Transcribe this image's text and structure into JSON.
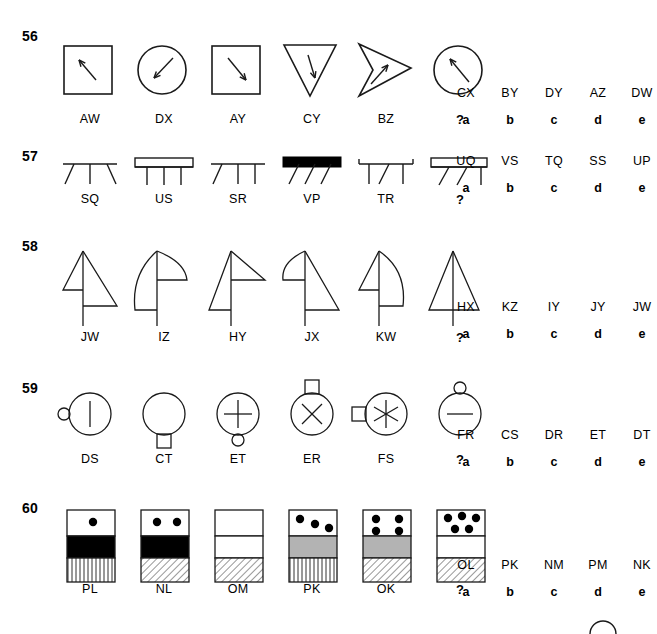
{
  "page": {
    "background": "#ffffff",
    "ink": "#1a1a1a",
    "fill_black": "#000000",
    "fill_grey": "#b3b3b3",
    "fill_white": "#ffffff"
  },
  "questions": [
    {
      "number": "56",
      "top": 28,
      "fig_top": 12,
      "fig_label_top": 84,
      "options_top": 58,
      "figures": [
        {
          "label": "AW",
          "shape": "square-with-arrow-upleft"
        },
        {
          "label": "DX",
          "shape": "circle-with-arrow-downleft"
        },
        {
          "label": "AY",
          "shape": "square-with-arrow-downright"
        },
        {
          "label": "CY",
          "shape": "triangle-down-with-arrow-down"
        },
        {
          "label": "BZ",
          "shape": "arrowhead-with-arrow-upright"
        },
        {
          "label": "?",
          "shape": "circle-with-arrow-upleft"
        }
      ],
      "options": [
        {
          "code": "CX",
          "letter": "a"
        },
        {
          "code": "BY",
          "letter": "b"
        },
        {
          "code": "DY",
          "letter": "c"
        },
        {
          "code": "AZ",
          "letter": "d"
        },
        {
          "code": "DW",
          "letter": "e"
        }
      ]
    },
    {
      "number": "57",
      "top": 148,
      "fig_top": 8,
      "fig_label_top": 44,
      "options_top": 6,
      "figures": [
        {
          "label": "SQ",
          "shape": "thin-bar-3-legs-outward"
        },
        {
          "label": "US",
          "shape": "open-bar-3-legs-vertical"
        },
        {
          "label": "SR",
          "shape": "thin-bar-3-legs-mixed"
        },
        {
          "label": "VP",
          "shape": "solid-bar-3-legs-slanted"
        },
        {
          "label": "TR",
          "shape": "thin-bar-3-legs-brackets"
        },
        {
          "label": "?",
          "shape": "open-bar-3-legs-slanted"
        }
      ],
      "options": [
        {
          "code": "UQ",
          "letter": "a"
        },
        {
          "code": "VS",
          "letter": "b"
        },
        {
          "code": "TQ",
          "letter": "c"
        },
        {
          "code": "SS",
          "letter": "d"
        },
        {
          "code": "UP",
          "letter": "e"
        }
      ]
    },
    {
      "number": "58",
      "top": 238,
      "fig_top": 10,
      "fig_label_top": 92,
      "options_top": 62,
      "figures": [
        {
          "label": "JW",
          "shape": "flag-left-triangle-right-triangle"
        },
        {
          "label": "IZ",
          "shape": "flag-left-curve-right-curve"
        },
        {
          "label": "HY",
          "shape": "flag-left-triangle-right-wedge"
        },
        {
          "label": "JX",
          "shape": "flag-left-curve-right-triangle"
        },
        {
          "label": "KW",
          "shape": "flag-left-triangle-right-curve"
        },
        {
          "label": "?",
          "shape": "plain-triangle-with-stem"
        }
      ],
      "options": [
        {
          "code": "HX",
          "letter": "a"
        },
        {
          "code": "KZ",
          "letter": "b"
        },
        {
          "code": "IY",
          "letter": "c"
        },
        {
          "code": "JY",
          "letter": "d"
        },
        {
          "code": "JW",
          "letter": "e"
        }
      ]
    },
    {
      "number": "59",
      "top": 380,
      "fig_top": 4,
      "fig_label_top": 72,
      "options_top": 48,
      "figures": [
        {
          "label": "DS",
          "shape": "circle-bar-small-circle-left"
        },
        {
          "label": "CT",
          "shape": "circle-plain-square-bottom"
        },
        {
          "label": "ET",
          "shape": "circle-plus-small-circle-bottom"
        },
        {
          "label": "ER",
          "shape": "circle-cross-square-top"
        },
        {
          "label": "FS",
          "shape": "circle-asterisk-square-left"
        },
        {
          "label": "?",
          "shape": "circle-minus-small-circle-top"
        }
      ],
      "options": [
        {
          "code": "FR",
          "letter": "a"
        },
        {
          "code": "CS",
          "letter": "b"
        },
        {
          "code": "DR",
          "letter": "c"
        },
        {
          "code": "ET",
          "letter": "d"
        },
        {
          "code": "DT",
          "letter": "e"
        }
      ]
    },
    {
      "number": "60",
      "top": 500,
      "fig_top": 8,
      "fig_label_top": 82,
      "options_top": 58,
      "figures": [
        {
          "label": "PL",
          "dots": 1,
          "middle": "black",
          "bottom": "vertical-hatch"
        },
        {
          "label": "NL",
          "dots": 2,
          "middle": "black",
          "bottom": "diagonal-hatch"
        },
        {
          "label": "OM",
          "dots": 0,
          "middle": "white",
          "bottom": "diagonal-hatch"
        },
        {
          "label": "PK",
          "dots": 3,
          "middle": "grey",
          "bottom": "vertical-hatch"
        },
        {
          "label": "OK",
          "dots": 4,
          "middle": "grey",
          "bottom": "diagonal-hatch"
        },
        {
          "label": "?",
          "dots": 5,
          "middle": "white",
          "bottom": "diagonal-hatch"
        }
      ],
      "options": [
        {
          "code": "OL",
          "letter": "a"
        },
        {
          "code": "PK",
          "letter": "b"
        },
        {
          "code": "NM",
          "letter": "c"
        },
        {
          "code": "PM",
          "letter": "d"
        },
        {
          "code": "NK",
          "letter": "e"
        }
      ]
    }
  ],
  "footer": {
    "partial_shape": "circle-arc-cut-off"
  }
}
